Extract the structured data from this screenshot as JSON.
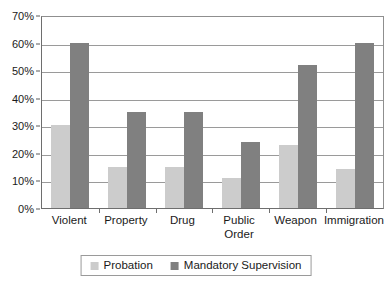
{
  "chart_data": {
    "type": "bar",
    "title": "",
    "subtitle": "",
    "xlabel": "",
    "ylabel": "",
    "categories": [
      "Violent",
      "Property",
      "Drug",
      "Public Order",
      "Weapon",
      "Immigration"
    ],
    "series": [
      {
        "name": "Probation",
        "color": "#cccccc",
        "values": [
          30,
          15,
          15,
          11,
          23,
          14
        ]
      },
      {
        "name": "Mandatory Supervision",
        "color": "#808080",
        "values": [
          60,
          35,
          35,
          24,
          52,
          60
        ]
      }
    ],
    "ylim": [
      0,
      70
    ],
    "ytick_values": [
      0,
      10,
      20,
      30,
      40,
      50,
      60,
      70
    ],
    "ytick_labels": [
      "0%",
      "10%",
      "20%",
      "30%",
      "40%",
      "50%",
      "60%",
      "70%"
    ],
    "grid": true,
    "grid_axis": "y",
    "legend_position": "bottom",
    "legend_entries": [
      "Probation",
      "Mandatory Supervision"
    ],
    "annotations": []
  },
  "axis": {
    "y": {
      "ticks": [
        {
          "label": "70%",
          "value": 70
        },
        {
          "label": "60%",
          "value": 60
        },
        {
          "label": "50%",
          "value": 50
        },
        {
          "label": "40%",
          "value": 40
        },
        {
          "label": "30%",
          "value": 30
        },
        {
          "label": "20%",
          "value": 20
        },
        {
          "label": "10%",
          "value": 10
        },
        {
          "label": "0%",
          "value": 0
        }
      ]
    },
    "x": {
      "categories": [
        {
          "label": "Violent"
        },
        {
          "label": "Property"
        },
        {
          "label": "Drug"
        },
        {
          "label": "Public Order"
        },
        {
          "label": "Weapon"
        },
        {
          "label": "Immigration"
        }
      ]
    }
  },
  "legend": {
    "items": [
      {
        "label": "Probation",
        "color": "#cccccc"
      },
      {
        "label": "Mandatory Supervision",
        "color": "#808080"
      }
    ]
  },
  "colors": {
    "series_probation": "#cccccc",
    "series_mandatory": "#808080",
    "gridline": "#9a9a9a",
    "axis": "#6e6e6e",
    "text": "#1a1a1a",
    "background": "#ffffff"
  }
}
